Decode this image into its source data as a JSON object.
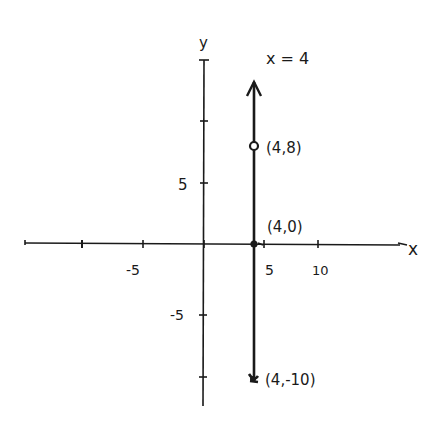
{
  "graph": {
    "line_label": "x = 4",
    "x_axis_label": "x",
    "y_axis_label": "y",
    "x_ticks": [
      {
        "value": -10,
        "label": ""
      },
      {
        "value": -5,
        "label": "-5"
      },
      {
        "value": 0,
        "label": ""
      },
      {
        "value": 5,
        "label": "5"
      },
      {
        "value": 10,
        "label": "10"
      }
    ],
    "y_ticks": [
      {
        "value": 10,
        "label": ""
      },
      {
        "value": 5,
        "label": "5"
      },
      {
        "value": 0,
        "label": ""
      },
      {
        "value": -5,
        "label": "-5"
      },
      {
        "value": -10,
        "label": ""
      }
    ],
    "points": [
      {
        "label": "(4,8)",
        "x": 4,
        "y": 8,
        "style": "open-circle"
      },
      {
        "label": "(4,0)",
        "x": 4,
        "y": 0,
        "style": "dot"
      },
      {
        "label": "(4,-10)",
        "x": 4,
        "y": -10,
        "style": "arrow-end"
      }
    ],
    "labels": {
      "tick_neg5_x": "-5",
      "tick_5_x": "5",
      "tick_10_x": "10",
      "tick_5_y": "5",
      "tick_neg5_y": "-5",
      "point_a": "(4,8)",
      "point_b": "(4,0)",
      "point_c": "(4,-10)"
    },
    "stroke_color": "#1a1a1a",
    "background": "#ffffff"
  }
}
